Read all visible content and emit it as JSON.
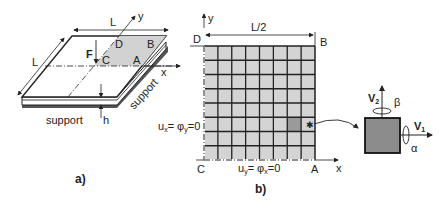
{
  "panel_a": {
    "caption": "a)",
    "dimension_label_top": "L",
    "dimension_label_side": "L",
    "axis_x": "x",
    "axis_y": "y",
    "force_label": "F",
    "thickness_label": "h",
    "corners": {
      "A": "A",
      "B": "B",
      "C": "C",
      "D": "D"
    },
    "support_front": "support",
    "support_right": "support"
  },
  "panel_b": {
    "caption": "b)",
    "width_label": "L/2",
    "axis_x": "x",
    "axis_y": "y",
    "corners": {
      "A": "A",
      "B": "B",
      "C": "C",
      "D": "D"
    },
    "left_bc": "uₓ= φᵧ=0",
    "left_bc_parts": {
      "u": "u",
      "u_sub": "x",
      "eq1": "= φ",
      "phi_sub": "y",
      "eq2": "=0"
    },
    "bottom_bc_parts": {
      "u": "u",
      "u_sub": "y",
      "eq1": "= φ",
      "phi_sub": "x",
      "eq2": "=0"
    },
    "grid": {
      "cols": 8,
      "rows": 8,
      "highlight_col": 6,
      "highlight_row": 5
    },
    "colors": {
      "cell_fill": "#d4d4d4",
      "highlight_fill": "#9a9a9a",
      "grid_line": "#222222"
    }
  },
  "element_detail": {
    "v1_label": "V",
    "v1_sub": "1",
    "v2_label": "V",
    "v2_sub": "2",
    "alpha": "α",
    "beta": "β",
    "fill": "#8c8c8c"
  }
}
